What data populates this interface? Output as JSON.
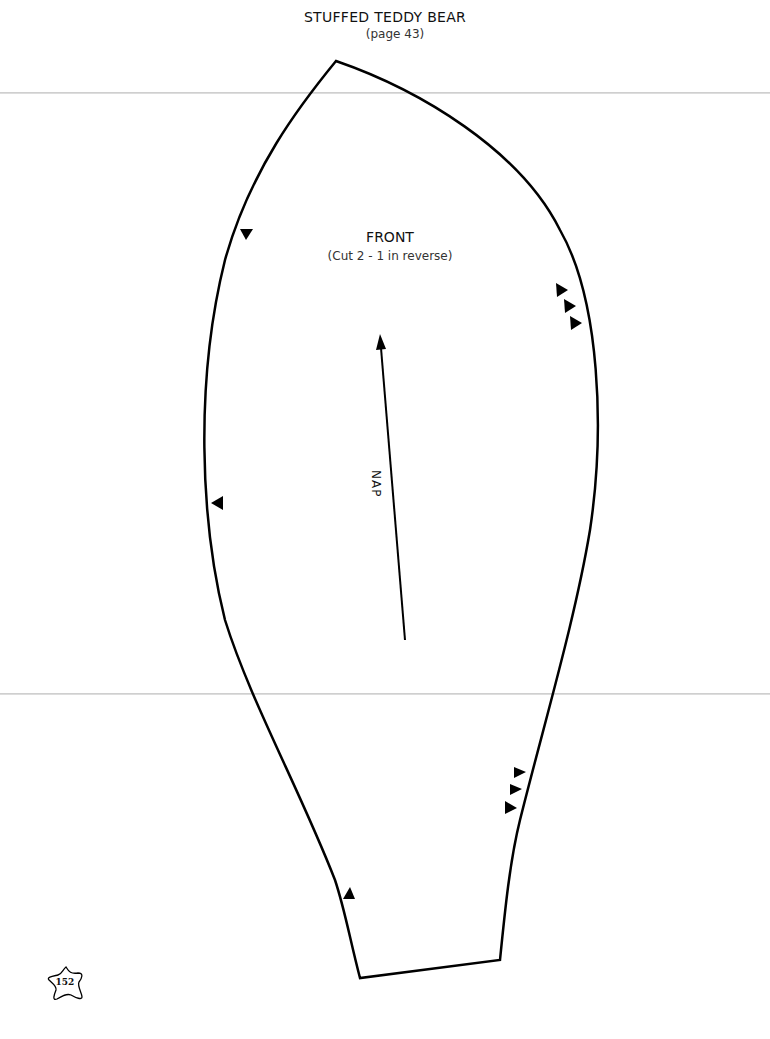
{
  "header": {
    "title": "STUFFED TEDDY BEAR",
    "subtitle": "(page 43)"
  },
  "pattern_piece": {
    "name": "FRONT",
    "instructions": "(Cut 2 - 1 in reverse)",
    "grain_label": "NAP",
    "icons": [
      "notch-triangle-icon",
      "nap-arrow-icon"
    ]
  },
  "footer": {
    "page_number": "152",
    "badge_icon": "star-icon"
  },
  "colors": {
    "outline": "#000000",
    "fold_line": "#cfcfcf",
    "background": "#ffffff"
  }
}
